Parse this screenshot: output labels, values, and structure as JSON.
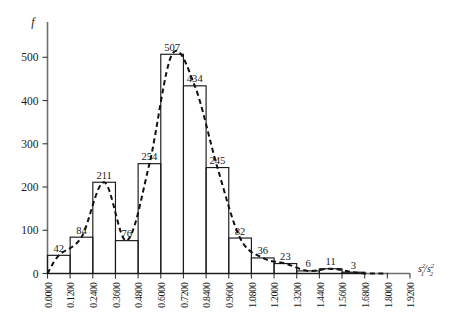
{
  "chart_data": {
    "type": "bar",
    "title": "",
    "subtitle": "",
    "xlabel": "s₁²/s₂²",
    "ylabel": "f",
    "grid": false,
    "legend": "none",
    "xlim": [
      0.0,
      1.92
    ],
    "ylim": [
      0,
      540
    ],
    "bin_width": 0.12,
    "categories": [
      "0.0000–0.1200",
      "0.1200–0.2400",
      "0.2400–0.3600",
      "0.3600–0.4800",
      "0.4800–0.6000",
      "0.6000–0.7200",
      "0.7200–0.8400",
      "0.8400–0.9600",
      "0.9600–1.0800",
      "1.0800–1.2000",
      "1.2000–1.3200",
      "1.3200–1.4400",
      "1.4400–1.5600",
      "1.5600–1.6800"
    ],
    "bin_starts": [
      0.0,
      0.12,
      0.24,
      0.36,
      0.48,
      0.6,
      0.72,
      0.84,
      0.96,
      1.08,
      1.2,
      1.32,
      1.44,
      1.56
    ],
    "values": [
      42,
      84,
      211,
      76,
      254,
      507,
      434,
      245,
      82,
      36,
      23,
      6,
      11,
      3
    ],
    "bar_labels": [
      "42",
      "84",
      "211",
      "76",
      "254",
      "507",
      "434",
      "245",
      "82",
      "36",
      "23",
      "6",
      "11",
      "3"
    ],
    "x_tick_labels": [
      "0.0000",
      "0.1200",
      "0.2400",
      "0.3600",
      "0.4800",
      "0.6000",
      "0.7200",
      "0.8400",
      "0.9600",
      "1.0800",
      "1.2000",
      "1.3200",
      "1.4400",
      "1.5600",
      "1.6800",
      "1.8000",
      "1.9200"
    ],
    "x_tick_values": [
      0.0,
      0.12,
      0.24,
      0.36,
      0.48,
      0.6,
      0.72,
      0.84,
      0.96,
      1.08,
      1.2,
      1.32,
      1.44,
      1.56,
      1.68,
      1.8,
      1.92
    ],
    "y_tick_labels": [
      "0",
      "100",
      "200",
      "300",
      "400",
      "500"
    ],
    "y_tick_values": [
      0,
      100,
      200,
      300,
      400,
      500
    ],
    "overlay_curve": {
      "name": "smoothed frequency curve",
      "style": "dashed",
      "color": "#111111"
    },
    "colors": {
      "bar_stroke": "#1a1a1a",
      "axis": "#6e6e6e",
      "curve": "#111111",
      "text": "#1a1a1a"
    }
  },
  "axis_label_parts": {
    "y_name": "f",
    "x_s": "s",
    "x_sub1": "1",
    "x_sup2a": "2",
    "x_slash": "/",
    "x_s2": "s",
    "x_sub2": "2",
    "x_sup2b": "2"
  }
}
